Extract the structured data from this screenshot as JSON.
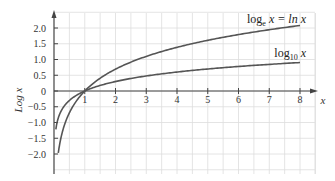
{
  "chart_data": {
    "type": "line",
    "title": "",
    "xlabel": "x",
    "ylabel": "Log x",
    "xlim": [
      0,
      8.5
    ],
    "ylim": [
      -2.5,
      2.5
    ],
    "grid": true,
    "x_ticks": [
      "1",
      "2",
      "3",
      "4",
      "5",
      "6",
      "7",
      "8"
    ],
    "y_ticks": [
      "2.0",
      "1.5",
      "1.0",
      "0.5",
      "0",
      "-0.5",
      "-1.0",
      "-1.5",
      "-2.0"
    ],
    "series": [
      {
        "name": "log_e x = ln x",
        "label_main": "log",
        "label_sub": "e",
        "label_rest": " x = ln x",
        "x": [
          0.14,
          0.25,
          0.5,
          1,
          2,
          3,
          4,
          5,
          6,
          7,
          8
        ],
        "values": [
          -1.97,
          -1.39,
          -0.69,
          0,
          0.69,
          1.1,
          1.39,
          1.61,
          1.79,
          1.95,
          2.08
        ]
      },
      {
        "name": "log_10 x",
        "label_main": "log",
        "label_sub": "10",
        "label_rest": " x",
        "x": [
          0.06,
          0.25,
          0.5,
          1,
          2,
          3,
          4,
          5,
          6,
          7,
          8
        ],
        "values": [
          -1.22,
          -0.6,
          -0.3,
          0,
          0.3,
          0.48,
          0.6,
          0.7,
          0.78,
          0.85,
          0.9
        ]
      }
    ],
    "colors": {
      "curve": "#555555",
      "grid": "#dddddd",
      "axis": "#444444"
    }
  }
}
